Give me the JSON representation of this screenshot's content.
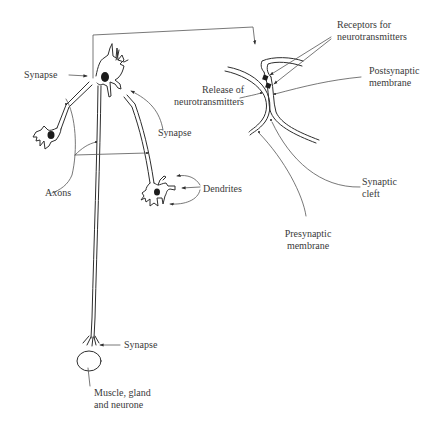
{
  "figure": {
    "labels": {
      "synapse_top": "Synapse",
      "synapse_mid": "Synapse",
      "synapse_bottom": "Synapse",
      "axons": "Axons",
      "dendrites": "Dendrites",
      "target": [
        "Muscle, gland",
        "and neurone"
      ],
      "release": [
        "Release of",
        "neurotransmitters"
      ],
      "receptors": [
        "Receptors for",
        "neurotransmitters"
      ],
      "postsynaptic": [
        "Postsynaptic",
        "membrane"
      ],
      "synaptic_cleft": [
        "Synaptic",
        "cleft"
      ],
      "presynaptic": [
        "Presynaptic",
        "membrane"
      ]
    },
    "colors": {
      "ink": "#2e2e2e",
      "text": "#3a3a3a",
      "background": "#ffffff"
    }
  }
}
